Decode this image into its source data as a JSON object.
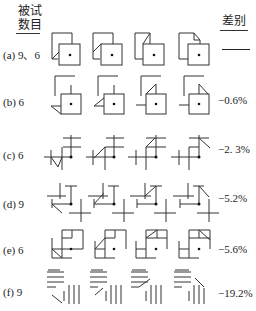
{
  "header": {
    "left_line1": "被试",
    "left_line2": "数目",
    "right": "差别"
  },
  "rows": [
    {
      "label": "(a) 9、6",
      "difference": "—",
      "stimulus_type": "overlapping-squares",
      "figure_count": 4
    },
    {
      "label": "(b) 6",
      "difference": "−0.6%",
      "stimulus_type": "square-with-bracket-and-triangle",
      "figure_count": 4
    },
    {
      "label": "(c) 6",
      "difference": "−2. 3%",
      "stimulus_type": "cross-line-configuration",
      "figure_count": 4
    },
    {
      "label": "(d) 9",
      "difference": "−5.2%",
      "stimulus_type": "scattered-line-segments",
      "figure_count": 4
    },
    {
      "label": "(e) 6",
      "difference": "−5.6%",
      "stimulus_type": "partial-grid-squares",
      "figure_count": 4
    },
    {
      "label": "(f) 9",
      "difference": "−19.2%",
      "stimulus_type": "parallel-line-groups",
      "figure_count": 4
    }
  ],
  "colors": {
    "line": "#333333",
    "background": "#ffffff",
    "text": "#222222"
  }
}
